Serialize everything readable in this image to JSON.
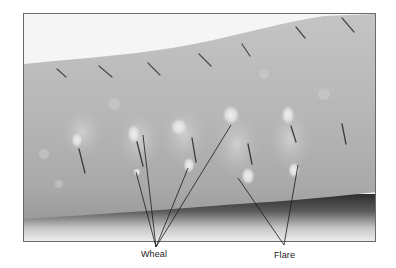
{
  "figure": {
    "labels": {
      "wheal": "Wheal",
      "flare": "Flare"
    },
    "colors": {
      "skin": "#b9b9b9",
      "background": "#f4f4f4",
      "shadow": "#3a3a3a",
      "wheal": "#e6e6e6",
      "marks": "#3c3c3c",
      "leader_lines": "#1a1a1a"
    }
  }
}
